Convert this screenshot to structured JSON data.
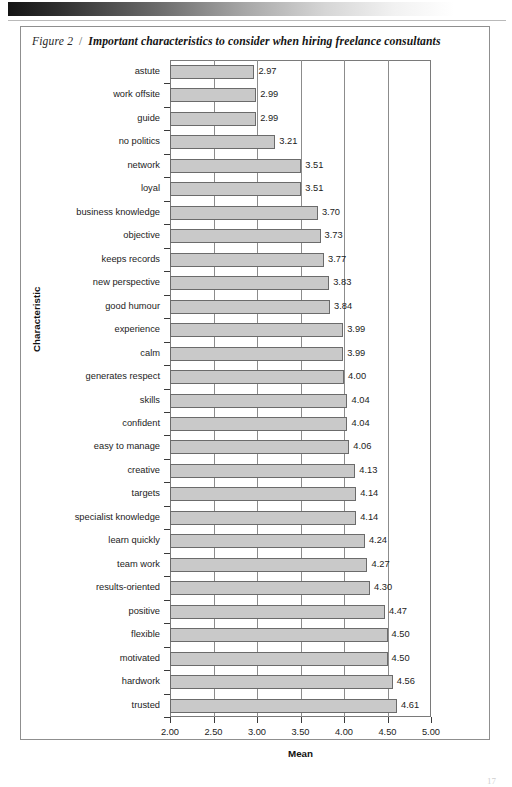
{
  "figure": {
    "label": "Figure 2",
    "separator": "/",
    "title": "Important characteristics to consider when hiring freelance consultants"
  },
  "page_number": "17",
  "colors": {
    "bar_fill": "#c9c9c9",
    "bar_border": "#6b6b6b",
    "axis": "#7a7a7a",
    "grid": "#8c8c8c",
    "text": "#1c1c1c"
  },
  "chart_data": {
    "type": "bar",
    "orientation": "horizontal",
    "title": "Important characteristics to consider when hiring freelance consultants",
    "xlabel": "Mean",
    "ylabel": "Characteristic",
    "xlim": [
      2.0,
      5.0
    ],
    "xticks": [
      2.0,
      2.5,
      3.0,
      3.5,
      4.0,
      4.5,
      5.0
    ],
    "xticklabels": [
      "2.00",
      "2.50",
      "3.00",
      "3.50",
      "4.00",
      "4.50",
      "5.00"
    ],
    "grid": true,
    "legend": false,
    "categories": [
      "astute",
      "work offsite",
      "guide",
      "no politics",
      "network",
      "loyal",
      "business knowledge",
      "objective",
      "keeps records",
      "new perspective",
      "good humour",
      "experience",
      "calm",
      "generates respect",
      "skills",
      "confident",
      "easy to manage",
      "creative",
      "targets",
      "specialist knowledge",
      "learn quickly",
      "team work",
      "results-oriented",
      "positive",
      "flexible",
      "motivated",
      "hardwork",
      "trusted"
    ],
    "values": [
      2.97,
      2.99,
      2.99,
      3.21,
      3.51,
      3.51,
      3.7,
      3.73,
      3.77,
      3.83,
      3.84,
      3.99,
      3.99,
      4.0,
      4.04,
      4.04,
      4.06,
      4.13,
      4.14,
      4.14,
      4.24,
      4.27,
      4.3,
      4.47,
      4.5,
      4.5,
      4.56,
      4.61
    ],
    "value_labels": [
      "2.97",
      "2.99",
      "2.99",
      "3.21",
      "3.51",
      "3.51",
      "3.70",
      "3.73",
      "3.77",
      "3.83",
      "3.84",
      "3.99",
      "3.99",
      "4.00",
      "4.04",
      "4.04",
      "4.06",
      "4.13",
      "4.14",
      "4.14",
      "4.24",
      "4.27",
      "4.30",
      "4.47",
      "4.50",
      "4.50",
      "4.56",
      "4.61"
    ]
  }
}
